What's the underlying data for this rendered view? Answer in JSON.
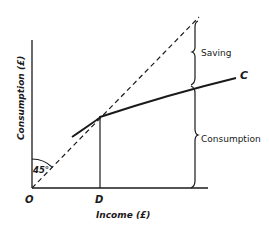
{
  "diagram": {
    "axes": {
      "x_label": "Income (£)",
      "y_label": "Consumption (£)",
      "origin_label": "O"
    },
    "points": {
      "d_label": "D"
    },
    "angle_label": "45°",
    "curve_label": "C",
    "brace_labels": {
      "saving": "Saving",
      "consumption": "Consumption"
    },
    "colors": {
      "ink": "#1a1a1a",
      "background": "#ffffff"
    }
  }
}
